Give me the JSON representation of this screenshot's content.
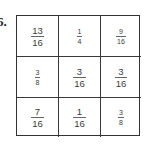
{
  "problem": {
    "number": "6."
  },
  "grid": {
    "rows": [
      [
        {
          "numerator": "13",
          "denominator": "16"
        },
        {
          "numerator": "1",
          "denominator": "4"
        },
        {
          "numerator": "9",
          "denominator": "16"
        }
      ],
      [
        {
          "numerator": "3",
          "denominator": "8"
        },
        {
          "numerator": "3",
          "denominator": "16"
        },
        {
          "numerator": "3",
          "denominator": "16"
        }
      ],
      [
        {
          "numerator": "7",
          "denominator": "16"
        },
        {
          "numerator": "1",
          "denominator": "16"
        },
        {
          "numerator": "3",
          "denominator": "8"
        }
      ]
    ]
  }
}
